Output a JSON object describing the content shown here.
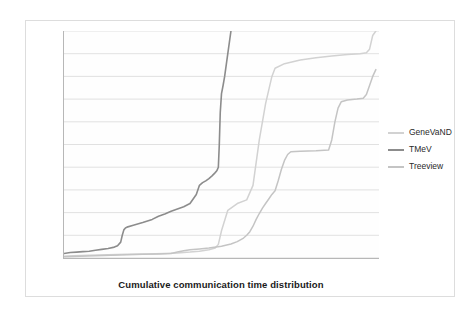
{
  "chart_data": {
    "type": "line",
    "title": "",
    "xlabel": "Cumulative communication time distribution",
    "ylabel": "Communication time (ms)",
    "xlim": [
      0,
      100
    ],
    "ylim": [
      0,
      500
    ],
    "xticks": [
      0,
      10,
      20,
      30,
      40,
      50,
      60,
      70,
      80,
      90
    ],
    "yticks": [
      0,
      50,
      100,
      150,
      200,
      250,
      300,
      350,
      400,
      450,
      500
    ],
    "grid": "horizontal",
    "legend_position": "right",
    "series": [
      {
        "name": "GeneVaND",
        "color": "#d2d2d2",
        "x": [
          0,
          3,
          8,
          14,
          20,
          26,
          32,
          36,
          38,
          40,
          43,
          46,
          48,
          49,
          50,
          52,
          55,
          58,
          60,
          62,
          64,
          66,
          67,
          70,
          75,
          80,
          85,
          90,
          94,
          96,
          97,
          98,
          99
        ],
        "y": [
          4,
          5,
          6,
          7,
          8,
          9,
          10,
          11,
          12,
          13,
          15,
          18,
          22,
          30,
          60,
          105,
          120,
          128,
          160,
          260,
          340,
          400,
          418,
          428,
          436,
          441,
          445,
          448,
          450,
          452,
          460,
          490,
          500
        ]
      },
      {
        "name": "TMeV",
        "color": "#8c8c8c",
        "x": [
          0,
          1,
          2,
          4,
          6,
          8,
          10,
          12,
          14,
          16,
          17,
          18,
          18.5,
          19,
          19.5,
          20,
          22,
          25,
          28,
          30,
          32,
          34,
          36,
          38,
          40,
          42,
          43,
          44,
          45,
          46,
          47,
          48,
          48.5,
          49,
          49.3,
          49.6,
          50,
          50.5,
          51,
          52,
          53
        ],
        "y": [
          10,
          11,
          12,
          13,
          14,
          15,
          17,
          19,
          21,
          24,
          27,
          35,
          50,
          62,
          66,
          68,
          72,
          78,
          85,
          92,
          97,
          103,
          108,
          113,
          120,
          140,
          160,
          166,
          170,
          175,
          181,
          188,
          192,
          200,
          250,
          320,
          362,
          380,
          400,
          450,
          500
        ]
      },
      {
        "name": "Treeview",
        "color": "#c4c4c4",
        "x": [
          0,
          5,
          10,
          15,
          20,
          25,
          30,
          34,
          36,
          38,
          40,
          43,
          46,
          50,
          53,
          55,
          57,
          58,
          59,
          60,
          61,
          62,
          63,
          64,
          65,
          66,
          67,
          68,
          69,
          70,
          71,
          72,
          75,
          80,
          84,
          85,
          86,
          87,
          88,
          90,
          93,
          95,
          96,
          97,
          98,
          99
        ],
        "y": [
          3,
          4,
          5,
          6,
          7,
          8,
          9,
          10,
          13,
          16,
          18,
          20,
          22,
          26,
          31,
          36,
          44,
          50,
          58,
          70,
          85,
          98,
          110,
          120,
          130,
          140,
          148,
          170,
          195,
          215,
          228,
          234,
          235,
          236,
          238,
          260,
          300,
          330,
          344,
          348,
          350,
          352,
          360,
          380,
          400,
          415
        ]
      }
    ]
  },
  "axes": {
    "y_title": "Communication time (ms)",
    "x_title": "Cumulative communication time distribution",
    "y_tick_labels": [
      "0",
      "50",
      "100",
      "150",
      "200",
      "250",
      "300",
      "350",
      "400",
      "450",
      "500"
    ],
    "x_tick_labels": [
      "0",
      "10",
      "20",
      "30",
      "40",
      "50",
      "60",
      "70",
      "80",
      "90"
    ]
  },
  "legend": {
    "items": [
      {
        "label": "GeneVaND",
        "color": "#d2d2d2"
      },
      {
        "label": "TMeV",
        "color": "#8c8c8c"
      },
      {
        "label": "Treeview",
        "color": "#c4c4c4"
      }
    ]
  },
  "colors": {
    "gridline": "#d9d9d9",
    "axis": "#b7b7b7",
    "frame": "#dddddd",
    "text": "#3a3a3a",
    "title_text": "#1a1a1a",
    "plot_background": "#fefefe"
  }
}
